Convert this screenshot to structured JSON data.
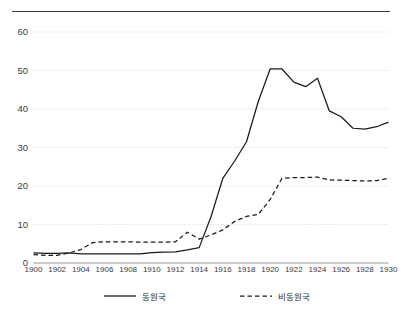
{
  "chart_data": {
    "type": "line",
    "title": "",
    "subtitle": "",
    "xlabel": "",
    "ylabel": "",
    "xlim": [
      1900,
      1930
    ],
    "ylim": [
      0,
      60
    ],
    "yticks": [
      0,
      10,
      20,
      30,
      40,
      50,
      60
    ],
    "xticks": [
      1900,
      1902,
      1904,
      1906,
      1908,
      1910,
      1912,
      1914,
      1916,
      1918,
      1920,
      1922,
      1924,
      1926,
      1928,
      1930
    ],
    "grid": "horizontal-dotted",
    "legend_position": "bottom",
    "x": [
      1900,
      1901,
      1902,
      1903,
      1904,
      1905,
      1906,
      1907,
      1908,
      1909,
      1910,
      1911,
      1912,
      1913,
      1914,
      1915,
      1916,
      1917,
      1918,
      1919,
      1920,
      1921,
      1922,
      1923,
      1924,
      1925,
      1926,
      1927,
      1928,
      1929,
      1930
    ],
    "series": [
      {
        "name": "동원국",
        "style": "solid",
        "color": "#1a1a1a",
        "values": [
          2.6,
          2.5,
          2.5,
          2.6,
          2.4,
          2.4,
          2.4,
          2.4,
          2.4,
          2.4,
          2.7,
          2.8,
          2.9,
          3.4,
          4.0,
          12.0,
          22.0,
          26.5,
          31.5,
          42.0,
          50.4,
          50.4,
          47.0,
          45.8,
          48.0,
          39.5,
          38.0,
          35.0,
          34.8,
          35.4,
          36.6
        ]
      },
      {
        "name": "비동원국",
        "style": "dashed",
        "color": "#1a1a1a",
        "values": [
          2.2,
          2.0,
          2.0,
          2.6,
          3.5,
          5.3,
          5.5,
          5.5,
          5.5,
          5.4,
          5.4,
          5.4,
          5.5,
          8.0,
          6.2,
          7.3,
          8.6,
          10.8,
          12.1,
          12.6,
          16.5,
          22.0,
          22.2,
          22.2,
          22.3,
          21.6,
          21.5,
          21.4,
          21.3,
          21.4,
          22.0
        ]
      }
    ]
  },
  "legend": {
    "entries": [
      {
        "label": "동원국",
        "style": "solid"
      },
      {
        "label": "비동원국",
        "style": "dashed"
      }
    ]
  }
}
